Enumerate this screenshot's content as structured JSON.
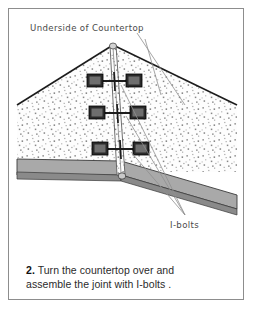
{
  "figure": {
    "step_number": "2.",
    "caption_line_1": "Turn the countertop over and",
    "caption_line_2": "assemble the joint with I-bolts .",
    "labels": {
      "top_label": "Underside of Countertop",
      "hardware_label": "I-bolts"
    },
    "colors": {
      "frame_border": "#8d8d8d",
      "background": "#ffffff",
      "surface_fill": "#fdfdfd",
      "speckle": "#9a9a9a",
      "edge_band": "#a9a9a9",
      "edge_band_shadow": "#8a8a8a",
      "outline": "#1c1c1c",
      "hardware_dark": "#2a2a2a",
      "leader_line": "#8f8f8f",
      "label_text": "#4a4a4a",
      "caption_text": "#2b2b2b"
    },
    "geometry": {
      "apex_top_x": 104,
      "apex_top_y": 36,
      "apex_bottom_x": 112,
      "apex_bottom_y": 163,
      "left_corner_x": 8,
      "right_corner_x": 228
    },
    "ibolt_assemblies": [
      {
        "id": "ibolt-1",
        "y": 72,
        "left_block_x": 82,
        "right_block_x": 117
      },
      {
        "id": "ibolt-2",
        "y": 103,
        "left_block_x": 84,
        "right_block_x": 120
      },
      {
        "id": "ibolt-3",
        "y": 139,
        "left_block_x": 87,
        "right_block_x": 123
      }
    ],
    "annotations": {
      "top_leader_from": [
        128,
        26
      ],
      "top_leader_to": [
        175,
        95
      ],
      "hardware_leader_target": [
        176,
        212
      ],
      "hardware_leaders_from": [
        [
          112,
          76
        ],
        [
          116,
          107
        ],
        [
          120,
          143
        ]
      ]
    }
  }
}
